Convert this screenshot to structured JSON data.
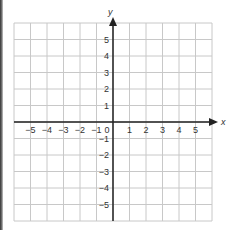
{
  "graph": {
    "x_axis_label": "x",
    "y_axis_label": "y",
    "origin_label": "0",
    "x_ticks": [
      "−5",
      "−4",
      "−3",
      "−2",
      "−1",
      "1",
      "2",
      "3",
      "4",
      "5"
    ],
    "y_ticks": [
      "5",
      "4",
      "3",
      "2",
      "1",
      "−1",
      "−2",
      "−3",
      "−4",
      "−5"
    ],
    "range": {
      "xmin": -6,
      "xmax": 6,
      "ymin": -6,
      "ymax": 6
    },
    "colors": {
      "grid": "#c8c8c8",
      "axis": "#222222",
      "text": "#333333"
    }
  }
}
